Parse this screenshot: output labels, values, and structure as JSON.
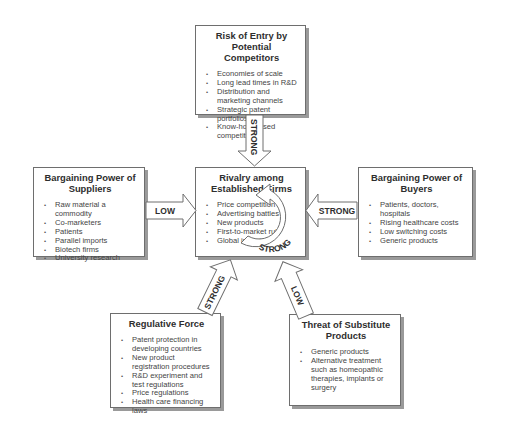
{
  "diagram": {
    "type": "five-forces",
    "boxes": {
      "entry": {
        "title": "Risk of Entry by Potential Competitors",
        "items": [
          "Economies of scale",
          "Long lead times in R&D",
          "Distribution and marketing channels",
          "Strategic patent portfolios",
          "Know-how based competition"
        ]
      },
      "rivalry": {
        "title": "Rivalry among Established Firms",
        "items": [
          "Price competition",
          "Advertising battles",
          "New products",
          "First-to-market rule",
          "Global industry"
        ]
      },
      "suppliers": {
        "title": "Bargaining Power of Suppliers",
        "items": [
          "Raw material a commodity",
          "Co-marketers",
          "Patients",
          "Parallel imports",
          "Biotech firms",
          "University research"
        ]
      },
      "buyers": {
        "title": "Bargaining Power of Buyers",
        "items": [
          "Patients, doctors, hospitals",
          "Rising healthcare costs",
          "Low switching costs",
          "Generic products"
        ]
      },
      "regulative": {
        "title": "Regulative Force",
        "items": [
          "Patent protection in developing countries",
          "New product registration procedures",
          "R&D experiment and test regulations",
          "Price regulations",
          "Health care financing laws"
        ]
      },
      "substitutes": {
        "title": "Threat of Substitute Products",
        "items": [
          "Generic products",
          "Alternative treatment such as homeopathic therapies, implants or surgery"
        ]
      }
    },
    "arrows": {
      "entry_to_rivalry": "STRONG",
      "suppliers_to_rivalry": "LOW",
      "buyers_to_rivalry": "STRONG",
      "regulative_to_rivalry": "STRONG",
      "substitutes_to_rivalry": "LOW",
      "rivalry_cycle": "STRONG"
    }
  }
}
